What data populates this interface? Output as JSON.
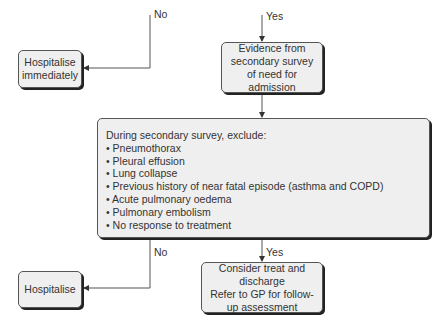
{
  "labels": {
    "top_no": "No",
    "top_yes": "Yes",
    "bottom_no": "No",
    "bottom_yes": "Yes"
  },
  "nodes": {
    "hospitalise_immediately": "Hospitalise immediately",
    "evidence": "Evidence from secondary survey of need for admission",
    "exclude_heading": "During secondary survey, exclude:",
    "exclude_items": [
      "• Pneumothorax",
      "• Pleural effusion",
      "• Lung collapse",
      "• Previous history of near fatal episode (asthma and COPD)",
      "• Acute pulmonary oedema",
      "• Pulmonary embolism",
      "• No response to treatment"
    ],
    "hospitalise": "Hospitalise",
    "consider_line1": "Consider treat and discharge",
    "consider_line2": "Refer to GP for follow-up assessment"
  },
  "colors": {
    "box_fill": "#efefef",
    "box_border": "#555555",
    "shadow": "#222222",
    "line": "#444444"
  }
}
